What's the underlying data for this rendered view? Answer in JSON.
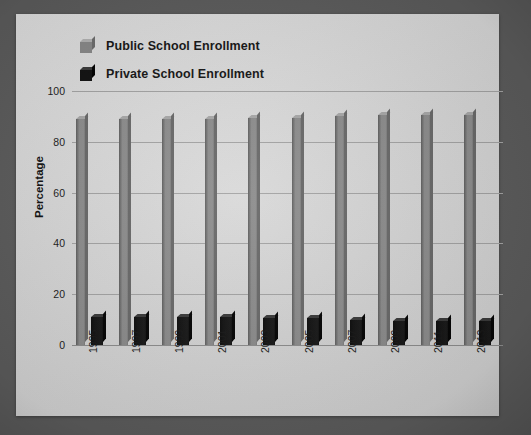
{
  "chart_data": {
    "type": "bar",
    "title": "",
    "xlabel": "",
    "ylabel": "Percentage",
    "ylim": [
      0,
      100
    ],
    "yticks": [
      0,
      20,
      40,
      60,
      80,
      100
    ],
    "grid": true,
    "legend_position": "top-left",
    "categories": [
      "1995",
      "1997",
      "1999",
      "2001",
      "2003",
      "2005",
      "2007",
      "2009",
      "2011",
      "2013"
    ],
    "series": [
      {
        "name": "Public School Enrollment",
        "color": "#8d8d8d",
        "values": [
          89,
          89,
          89,
          89,
          89.5,
          89.5,
          90,
          90.5,
          90.5,
          90.5
        ]
      },
      {
        "name": "Private School Enrollment",
        "color": "#141414",
        "values": [
          11,
          11,
          11,
          11,
          10.5,
          10.5,
          10,
          9.5,
          9.5,
          9.5
        ]
      }
    ]
  },
  "legend": {
    "items": [
      {
        "label": "Public School Enrollment",
        "swatch": "public-swatch-icon"
      },
      {
        "label": "Private School Enrollment",
        "swatch": "private-swatch-icon"
      }
    ]
  },
  "axes": {
    "y_title": "Percentage",
    "y_ticks": [
      "100",
      "80",
      "60",
      "40",
      "20",
      "0"
    ],
    "x_ticks": [
      "1995",
      "1997",
      "1999",
      "2001",
      "2003",
      "2005",
      "2007",
      "2009",
      "2011",
      "2013"
    ]
  },
  "colors": {
    "background": "#5d5d5d",
    "panel": "#dcdcdc",
    "public_bar": "#8d8d8d",
    "private_bar": "#141414",
    "gridline": "#a5a5a5",
    "text": "#161616"
  }
}
